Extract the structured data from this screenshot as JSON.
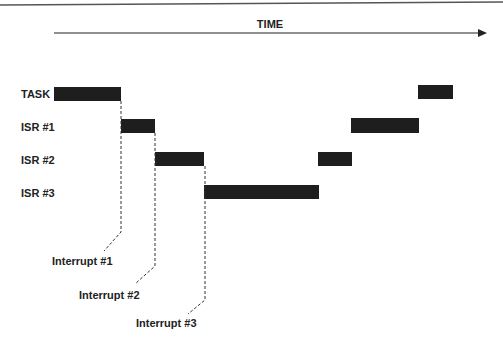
{
  "time_axis": {
    "label": "TIME"
  },
  "rows": [
    {
      "id": "task",
      "label": "TASK",
      "y": 94
    },
    {
      "id": "isr1",
      "label": "ISR #1",
      "y": 126
    },
    {
      "id": "isr2",
      "label": "ISR #2",
      "y": 159
    },
    {
      "id": "isr3",
      "label": "ISR #3",
      "y": 192
    }
  ],
  "bars": [
    {
      "row": "task",
      "x1": 54,
      "x2": 121,
      "y": 87
    },
    {
      "row": "isr1",
      "x1": 121,
      "x2": 155,
      "y": 119
    },
    {
      "row": "isr2",
      "x1": 155,
      "x2": 204,
      "y": 152
    },
    {
      "row": "isr3",
      "x1": 204,
      "x2": 319,
      "y": 185
    },
    {
      "row": "isr2",
      "x1": 318,
      "x2": 352,
      "y": 152
    },
    {
      "row": "isr1",
      "x1": 351,
      "x2": 419,
      "y": 118
    },
    {
      "row": "task",
      "x1": 418,
      "x2": 453,
      "y": 85
    }
  ],
  "interrupts": [
    {
      "label": "Interrupt #1"
    },
    {
      "label": "Interrupt #2"
    },
    {
      "label": "Interrupt #3"
    }
  ]
}
